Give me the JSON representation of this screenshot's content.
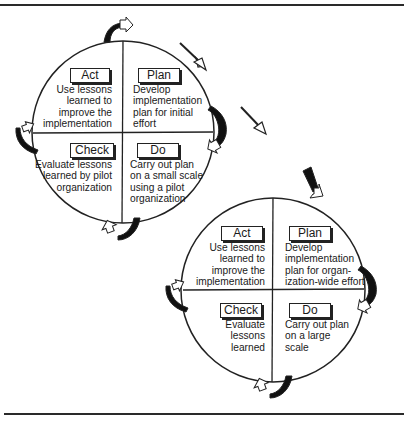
{
  "figure": {
    "type": "PDCA cycle diagram (pilot then organization-wide)",
    "colors": {
      "line": "#222222",
      "background": "#ffffff"
    }
  },
  "cycle1": {
    "act": {
      "label": "Act",
      "text": "Use lessons\nlearned to\nimprove the\nimplementation"
    },
    "plan": {
      "label": "Plan",
      "text": "Develop\nimplementation\nplan for initial\neffort"
    },
    "check": {
      "label": "Check",
      "text": "Evaluate lessons\nlearned by pilot\norganization"
    },
    "do": {
      "label": "Do",
      "text": "Carry out plan\non a small scale\nusing a pilot\norganization"
    }
  },
  "cycle2": {
    "act": {
      "label": "Act",
      "text": "Use lessons\nlearned to\nimprove the\nimplementation"
    },
    "plan": {
      "label": "Plan",
      "text": "Develop\nimplementation\nplan for organ-\nization-wide effort"
    },
    "check": {
      "label": "Check",
      "text": "Evaluate\nlessons\nlearned"
    },
    "do": {
      "label": "Do",
      "text": "Carry out plan\non a large\nscale"
    }
  },
  "connector_icons": [
    "curved-arrow-icon",
    "diagonal-arrow-icon"
  ]
}
